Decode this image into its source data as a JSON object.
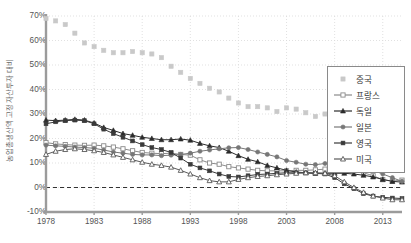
{
  "chart_data": {
    "type": "line",
    "title": "",
    "xlabel": "",
    "ylabel": "농업총생산액 고정자산투자 대비",
    "xlim": [
      1978,
      2015
    ],
    "ylim": [
      -10,
      70
    ],
    "y_tick_labels": [
      "70%",
      "60%",
      "50%",
      "40%",
      "30%",
      "20%",
      "10%",
      "0%",
      "-10%"
    ],
    "y_tick_values": [
      70,
      60,
      50,
      40,
      30,
      20,
      10,
      0,
      -10
    ],
    "x_tick_labels": [
      "1978",
      "1983",
      "1988",
      "1993",
      "1998",
      "2003",
      "2008",
      "2013"
    ],
    "x_tick_values": [
      1978,
      1983,
      1988,
      1993,
      1998,
      2003,
      2008,
      2013
    ],
    "grid": true,
    "legend_position": "right",
    "zero_reference_line": 0,
    "x": [
      1978,
      1979,
      1980,
      1981,
      1982,
      1983,
      1984,
      1985,
      1986,
      1987,
      1988,
      1989,
      1990,
      1991,
      1992,
      1993,
      1994,
      1995,
      1996,
      1997,
      1998,
      1999,
      2000,
      2001,
      2002,
      2003,
      2004,
      2005,
      2006,
      2007,
      2008,
      2009,
      2010,
      2011,
      2012,
      2013,
      2014,
      2015
    ],
    "series": [
      {
        "name": "중국",
        "color": "#c9c9c9",
        "marker": "square-filled",
        "values": [
          69,
          68,
          66.5,
          63,
          59,
          57.5,
          56,
          55,
          55,
          55.5,
          55,
          54.5,
          53,
          49.5,
          47,
          44.5,
          42.5,
          40.5,
          39,
          36.5,
          34.5,
          33,
          33,
          32.5,
          31,
          32.5,
          32,
          30.5,
          29,
          30,
          30,
          30.5,
          30.5,
          31,
          30.8,
          30.5,
          30.5,
          30.5
        ]
      },
      {
        "name": "프랑스",
        "color": "#8a8a8a",
        "marker": "square-open",
        "values": [
          18.3,
          17.8,
          17.5,
          17.3,
          17.2,
          17.3,
          17,
          16.5,
          15.8,
          15,
          14.3,
          14,
          13.8,
          14,
          13.5,
          13.2,
          11.3,
          10,
          9.5,
          8.5,
          8,
          7.5,
          7,
          6.8,
          6.8,
          6.8,
          7,
          7,
          7.2,
          7.5,
          7.5,
          7,
          7,
          6,
          4.8,
          3.2,
          2.6,
          3
        ]
      },
      {
        "name": "독일",
        "color": "#2b2b2b",
        "marker": "triangle-filled",
        "values": [
          27.5,
          27.3,
          27.5,
          27.8,
          27.5,
          26.3,
          24.5,
          23.3,
          22,
          21.3,
          20.5,
          20,
          19.5,
          19.5,
          19.8,
          19.3,
          18,
          17,
          16.3,
          14.8,
          13,
          11.5,
          10.5,
          9,
          8,
          7,
          6.3,
          6,
          5.8,
          5.8,
          5.8,
          5.8,
          5.5,
          5,
          4.3,
          3.3,
          2.5,
          2.2
        ]
      },
      {
        "name": "일본",
        "color": "#777777",
        "marker": "circle-filled",
        "values": [
          17.3,
          17,
          16.8,
          16.5,
          16.3,
          16,
          15.3,
          14.5,
          14,
          13.5,
          13.3,
          13.3,
          13,
          13.2,
          13.5,
          14,
          14.8,
          15.3,
          15.8,
          16.2,
          16.3,
          15.5,
          14.5,
          13.5,
          12.5,
          11,
          10.3,
          9.5,
          9.3,
          9.8,
          9.8,
          9.5,
          9,
          8.2,
          7,
          5.5,
          4,
          2.5
        ]
      },
      {
        "name": "영국",
        "color": "#3a3a3a",
        "marker": "square-filled-dark",
        "values": [
          26,
          26.8,
          27.3,
          27.5,
          27.3,
          26,
          23.8,
          22,
          20.5,
          19,
          17.5,
          16.3,
          15.5,
          14.3,
          12,
          9.5,
          8,
          6.8,
          5.5,
          4.5,
          4.3,
          4.8,
          5.3,
          5.5,
          5.8,
          6,
          6,
          6,
          5.8,
          5.5,
          4,
          1.5,
          -0.5,
          -2.5,
          -3.5,
          -4,
          -4.3,
          -4.5
        ]
      },
      {
        "name": "미국",
        "color": "#5a5a5a",
        "marker": "triangle-open",
        "values": [
          13.5,
          14.8,
          15.5,
          15.8,
          15.5,
          15,
          14.3,
          13.3,
          12.3,
          11.3,
          10.3,
          9.5,
          9,
          8.3,
          7,
          5.5,
          4,
          2.8,
          2.3,
          2.3,
          3.3,
          4,
          4.5,
          4.8,
          5.2,
          5.5,
          5.8,
          6,
          6,
          5.8,
          4.8,
          2.3,
          0,
          -2,
          -3.5,
          -4.3,
          -5,
          -5
        ]
      }
    ]
  },
  "legend": {
    "items": [
      {
        "label": "중국"
      },
      {
        "label": "프랑스"
      },
      {
        "label": "독일"
      },
      {
        "label": "일본"
      },
      {
        "label": "영국"
      },
      {
        "label": "미국"
      }
    ]
  }
}
